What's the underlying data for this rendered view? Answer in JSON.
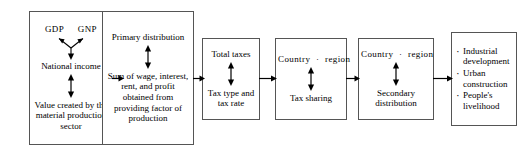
{
  "diagram": {
    "box_border_color": "#555555",
    "background_color": "#ffffff",
    "text_color": "#000000",
    "stages": [
      {
        "id": "income",
        "top_label": "GDP  GNP",
        "top_label_left": "GDP",
        "top_label_right": "GNP",
        "middle_label": "National income",
        "bottom_label": "Value created by the material production sector",
        "connector_top": "y-branch-arrow-down",
        "connector_bottom": "double-headed-vertical-arrow"
      },
      {
        "id": "primary-distribution",
        "top_label": "Primary distribution",
        "bottom_label": "Sum of wage, interest, rent, and profit obtained from providing factor of production",
        "connector": "double-headed-vertical-arrow"
      },
      {
        "id": "total-taxes",
        "top_label": "Total taxes",
        "bottom_label": "Tax type and tax rate",
        "connector": "double-headed-vertical-arrow"
      },
      {
        "id": "tax-sharing",
        "top_label": "Country · region",
        "top_label_left": "Country",
        "top_label_separator": "·",
        "top_label_right": "region",
        "bottom_label": "Tax sharing",
        "connector": "double-headed-vertical-arrow"
      },
      {
        "id": "secondary-distribution",
        "top_label": "Country · region",
        "top_label_left": "Country",
        "top_label_separator": "·",
        "top_label_right": "region",
        "bottom_label": "Secondary distribution",
        "connector": "double-headed-vertical-arrow"
      },
      {
        "id": "spending",
        "items": [
          "Industrial development",
          "Urban construction",
          "People's livelihood"
        ],
        "bullet": "·"
      }
    ],
    "connectors": [
      {
        "id": "income-to-primary",
        "type": "arrow-right"
      },
      {
        "id": "primary-to-taxes",
        "type": "arrow-right"
      },
      {
        "id": "taxes-to-sharing",
        "type": "arrow-right"
      },
      {
        "id": "sharing-to-secondary",
        "type": "arrow-right"
      },
      {
        "id": "secondary-to-spending",
        "type": "arrow-right"
      }
    ]
  }
}
